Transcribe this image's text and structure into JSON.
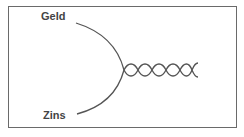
{
  "diagram": {
    "type": "converging-curves-into-braid",
    "labels": {
      "top": "Geld",
      "bottom": "Zins"
    },
    "colors": {
      "stroke": "#555555",
      "border": "#6a6a6a",
      "text": "#444444",
      "background": "#ffffff"
    },
    "braid": {
      "crossings": 5
    }
  }
}
